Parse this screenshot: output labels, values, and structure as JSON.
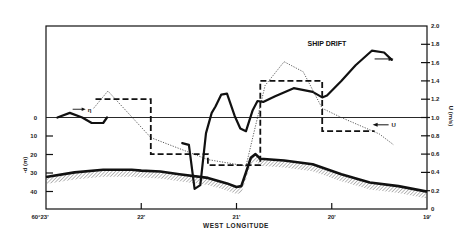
{
  "chart_data": {
    "type": "line",
    "title": "",
    "xlabel": "WEST LONGITUDE",
    "ylabel_left": "-d (m)",
    "ylabel_right": "U (m/s)",
    "x_ticks": [
      "60°23'",
      "22'",
      "21'",
      "20'",
      "19'"
    ],
    "x_tick_values": [
      23.0,
      22.0,
      21.0,
      20.0,
      19.0
    ],
    "xlim": [
      23.0,
      19.0
    ],
    "left_ticks": [
      "0",
      "10",
      "20",
      "30",
      "40"
    ],
    "left_tick_values": [
      0,
      10,
      20,
      30,
      40
    ],
    "right_ticks": [
      "0",
      "0.2",
      "0.4",
      "0.6",
      "0.8",
      "1.0",
      "1.2",
      "1.4",
      "1.6",
      "1.8",
      "2.0"
    ],
    "right_tick_values": [
      0,
      0.2,
      0.4,
      0.6,
      0.8,
      1.0,
      1.2,
      1.4,
      1.6,
      1.8,
      2.0
    ],
    "ylim_right": [
      0,
      2.0
    ],
    "grid": false,
    "reference_line": {
      "axis": "right",
      "value": 1.0,
      "note": "zero depth / U=1.0 baseline"
    },
    "annotations": [
      {
        "text": "SHIP DRIFT",
        "x_lon": 20.05,
        "u": 1.78,
        "arrow": "right",
        "arrow_axis": "right"
      },
      {
        "text": "U",
        "x_lon": 19.45,
        "u": 0.92,
        "arrow": "left",
        "arrow_axis": "right"
      },
      {
        "text": "η",
        "x_lon": 22.52,
        "u": 1.09,
        "arrow": "right",
        "arrow_axis": "left"
      }
    ],
    "series": [
      {
        "name": "η (interface depth, left axis)",
        "style": "solid-thick",
        "axis": "left",
        "x": [
          22.88,
          22.75,
          22.62,
          22.52,
          22.4,
          22.36
        ],
        "values": [
          0,
          -2.5,
          0,
          3,
          3,
          0
        ]
      },
      {
        "name": "Ship drift (right axis)",
        "style": "solid-thick",
        "axis": "right",
        "x": [
          21.57,
          21.5,
          21.44,
          21.38,
          21.32,
          21.26,
          21.22,
          21.16,
          21.1,
          21.02,
          20.96,
          20.9,
          20.83,
          20.78,
          20.72,
          20.6,
          20.4,
          20.2,
          20.1,
          20.05,
          19.9,
          19.75,
          19.58,
          19.45,
          19.37
        ],
        "values": [
          0.72,
          0.7,
          0.22,
          0.26,
          0.83,
          1.05,
          1.12,
          1.25,
          1.26,
          1.02,
          0.88,
          0.85,
          1.08,
          1.18,
          1.17,
          1.23,
          1.32,
          1.28,
          1.22,
          1.24,
          1.4,
          1.57,
          1.73,
          1.71,
          1.63
        ]
      },
      {
        "name": "Dotted (model U, right axis)",
        "style": "dotted",
        "axis": "right",
        "x": [
          22.5,
          22.35,
          21.9,
          21.3,
          20.9,
          20.7,
          20.5,
          20.3,
          20.1,
          19.9,
          19.5,
          19.35
        ],
        "values": [
          1.1,
          1.29,
          0.78,
          0.54,
          0.47,
          1.35,
          1.61,
          1.5,
          1.1,
          1.0,
          0.82,
          0.7
        ]
      },
      {
        "name": "Dashed step (measured U, right axis)",
        "style": "dashed-step",
        "axis": "right",
        "x": [
          22.48,
          21.9,
          21.9,
          21.3,
          21.3,
          20.75,
          20.75,
          20.1,
          20.1,
          19.55
        ],
        "values": [
          1.2,
          1.2,
          0.6,
          0.6,
          0.48,
          0.48,
          1.4,
          1.4,
          0.85,
          0.85
        ]
      },
      {
        "name": "Bottom topography (left axis, hatched)",
        "style": "solid-thick-hatched",
        "axis": "right",
        "x": [
          23.0,
          22.7,
          22.4,
          22.1,
          22.0,
          21.8,
          21.6,
          21.3,
          21.1,
          21.0,
          20.95,
          20.9,
          20.85,
          20.8,
          20.75,
          20.5,
          20.2,
          19.9,
          19.6,
          19.3,
          19.0
        ],
        "values": [
          0.35,
          0.4,
          0.43,
          0.43,
          0.42,
          0.41,
          0.38,
          0.34,
          0.28,
          0.24,
          0.25,
          0.4,
          0.56,
          0.6,
          0.55,
          0.53,
          0.49,
          0.38,
          0.29,
          0.25,
          0.19
        ]
      }
    ]
  },
  "labels": {
    "x_axis_title": "WEST LONGITUDE",
    "left_axis_title": "-d (m)",
    "right_axis_title": "U (m/s)",
    "ship_drift": "SHIP DRIFT",
    "u_label": "U",
    "eta_label": "η"
  }
}
